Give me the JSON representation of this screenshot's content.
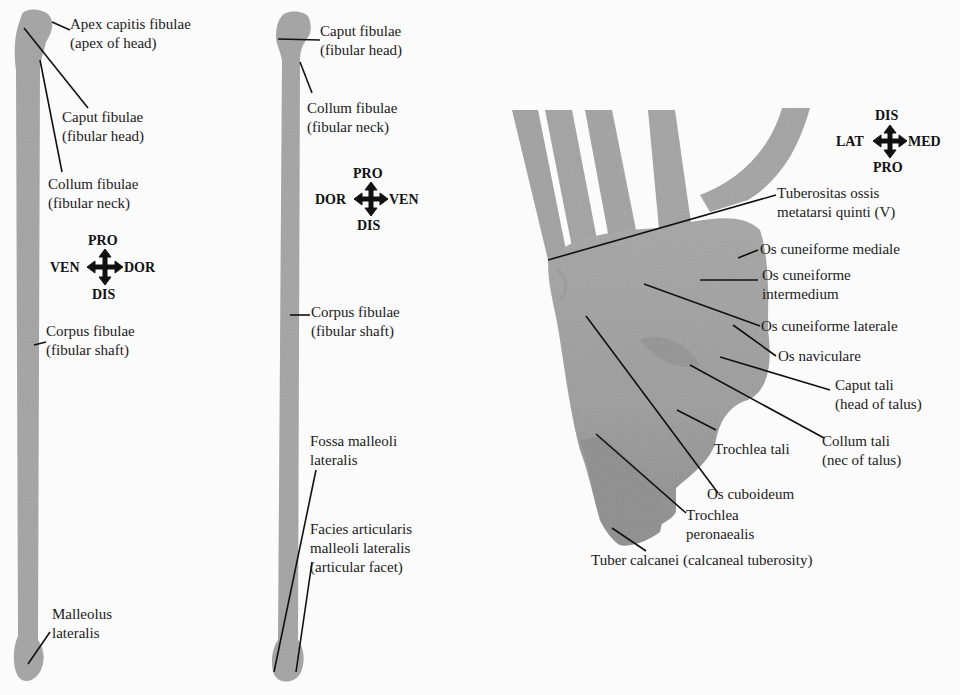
{
  "colors": {
    "background": "#fbfbfb",
    "bone": "#a3a3a3",
    "bone_dark": "#8f8f8f",
    "leader_line": "#111111",
    "text": "#1a1a1a"
  },
  "panels": {
    "left_fibula": {
      "compass": {
        "top": "PRO",
        "left": "VEN",
        "right": "DOR",
        "bottom": "DIS"
      },
      "labels": [
        {
          "line1": "Apex capitis fibulae",
          "line2": "(apex of head)"
        },
        {
          "line1": "Caput fibulae",
          "line2": "(fibular head)"
        },
        {
          "line1": "Collum fibulae",
          "line2": "(fibular neck)"
        },
        {
          "line1": "Corpus fibulae",
          "line2": "(fibular shaft)"
        },
        {
          "line1": "Malleolus",
          "line2": "lateralis"
        }
      ]
    },
    "middle_fibula": {
      "compass": {
        "top": "PRO",
        "left": "DOR",
        "right": "VEN",
        "bottom": "DIS"
      },
      "labels": [
        {
          "line1": "Caput fibulae",
          "line2": "(fibular head)"
        },
        {
          "line1": "Collum fibulae",
          "line2": "(fibular neck)"
        },
        {
          "line1": "Corpus fibulae",
          "line2": "(fibular shaft)"
        },
        {
          "line1": "Fossa malleoli",
          "line2": "lateralis"
        },
        {
          "line1": "Facies articularis",
          "line2": "malleoli lateralis",
          "line3": "(articular facet)"
        }
      ]
    },
    "foot": {
      "compass": {
        "top": "DIS",
        "left": "LAT",
        "right": "MED",
        "bottom": "PRO"
      },
      "labels": [
        {
          "line1": "Tuberositas ossis",
          "line2": "metatarsi quinti (V)"
        },
        {
          "line1": "Os cuneiforme mediale"
        },
        {
          "line1": "Os cuneiforme",
          "line2": "intermedium"
        },
        {
          "line1": "Os cuneiforme laterale"
        },
        {
          "line1": "Os naviculare"
        },
        {
          "line1": "Caput tali",
          "line2": "(head of talus)"
        },
        {
          "line1": "Collum tali",
          "line2": "(nec of talus)"
        },
        {
          "line1": "Trochlea tali"
        },
        {
          "line1": "Os cuboideum"
        },
        {
          "line1": "Trochlea",
          "line2": "peronaealis"
        },
        {
          "line1": "Tuber calcanei (calcaneal tuberosity)"
        }
      ]
    }
  }
}
